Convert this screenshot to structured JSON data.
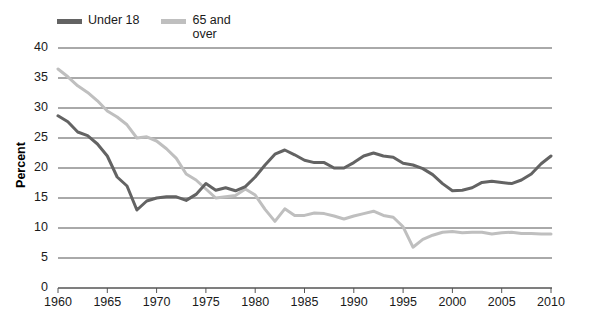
{
  "chart_data": {
    "type": "line",
    "title": "",
    "xlabel": "",
    "ylabel": "Percent",
    "xlim": [
      1960,
      2010
    ],
    "ylim": [
      0,
      40
    ],
    "ytick_step": 5,
    "xtick_step": 5,
    "grid": "horizontal",
    "legend_position": "top-left",
    "yticks": [
      "0",
      "5",
      "10",
      "15",
      "20",
      "25",
      "30",
      "35",
      "40"
    ],
    "xticks": [
      "1960",
      "1965",
      "1970",
      "1975",
      "1980",
      "1985",
      "1990",
      "1995",
      "2000",
      "2005",
      "2010"
    ],
    "x": [
      1960,
      1961,
      1962,
      1963,
      1964,
      1965,
      1966,
      1967,
      1968,
      1969,
      1970,
      1971,
      1972,
      1973,
      1974,
      1975,
      1976,
      1977,
      1978,
      1979,
      1980,
      1981,
      1982,
      1983,
      1984,
      1985,
      1986,
      1987,
      1988,
      1989,
      1990,
      1991,
      1992,
      1993,
      1994,
      1995,
      1996,
      1997,
      1998,
      1999,
      2000,
      2001,
      2002,
      2003,
      2004,
      2005,
      2006,
      2007,
      2008,
      2009,
      2010
    ],
    "series": [
      {
        "name": "Under 18",
        "color": "#636363",
        "values": [
          28.7,
          27.7,
          26.0,
          25.4,
          24.0,
          22.0,
          18.5,
          17.0,
          13.0,
          14.5,
          15.0,
          15.2,
          15.2,
          14.6,
          15.6,
          17.4,
          16.3,
          16.7,
          16.2,
          16.9,
          18.5,
          20.5,
          22.3,
          23.0,
          22.2,
          21.3,
          20.9,
          20.9,
          20.0,
          20.0,
          20.9,
          22.0,
          22.5,
          22.0,
          21.8,
          20.8,
          20.5,
          19.9,
          18.9,
          17.4,
          16.2,
          16.3,
          16.7,
          17.6,
          17.8,
          17.6,
          17.4,
          18.0,
          19.0,
          20.7,
          22.0
        ]
      },
      {
        "name": "65 and over",
        "color": "#bfbfbf",
        "values": [
          36.5,
          35.2,
          33.7,
          32.6,
          31.2,
          29.5,
          28.5,
          27.2,
          25.0,
          25.2,
          24.5,
          23.2,
          21.6,
          19.0,
          18.0,
          16.5,
          15.0,
          15.2,
          15.4,
          16.5,
          15.5,
          13.1,
          11.1,
          13.2,
          12.1,
          12.1,
          12.5,
          12.4,
          12.0,
          11.5,
          12.0,
          12.4,
          12.8,
          12.1,
          11.8,
          10.2,
          6.8,
          8.1,
          8.8,
          9.3,
          9.4,
          9.2,
          9.3,
          9.3,
          9.0,
          9.2,
          9.3,
          9.1,
          9.1,
          9.0,
          9.0
        ]
      }
    ]
  },
  "legend": {
    "items": [
      {
        "label": "Under 18",
        "color": "#636363"
      },
      {
        "label": "65 and over",
        "color": "#bfbfbf"
      }
    ]
  },
  "axes": {
    "ylabel": "Percent"
  }
}
